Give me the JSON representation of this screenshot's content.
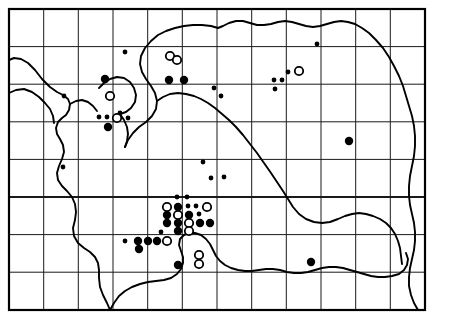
{
  "map": {
    "title": "Species distribution map",
    "description": "Dot distribution map of a region with a coastline outline and a rectangular grid of recording squares.",
    "colors": {
      "background": "#ffffff",
      "grid": "#1a1a1a",
      "border": "#000000",
      "coastline": "#000000",
      "symbol_filled": "#000000",
      "symbol_open_stroke": "#000000",
      "symbol_open_fill": "#ffffff"
    },
    "frame": {
      "x": 9,
      "y": 9,
      "width": 416,
      "height": 301
    },
    "grid": {
      "columns": 12,
      "rows": 8,
      "x_lines": [
        9,
        43.7,
        78.3,
        113,
        147.7,
        182.3,
        217,
        251.7,
        286.3,
        321,
        355.7,
        390.3,
        425
      ],
      "y_lines": [
        9,
        46.6,
        84.2,
        121.8,
        159.4,
        197,
        234.6,
        272.2,
        310
      ],
      "emphasis_x": 232,
      "emphasis_y": 197
    },
    "legend": {
      "symbols": [
        {
          "name": "large-filled-dot",
          "meaning": "record",
          "radius": 4.2,
          "style": "filled"
        },
        {
          "name": "small-filled-dot",
          "meaning": "record",
          "radius": 2.4,
          "style": "filled"
        },
        {
          "name": "open-circle",
          "meaning": "old record",
          "radius": 4.2,
          "style": "open"
        }
      ]
    },
    "coastline_paths": [
      "M 9,60 L 14,58 L 21,59 L 28,63 L 35,70 L 42,79 L 50,87 L 57,92 L 63,95 L 68,99 L 70,104 L 69,110 L 66,115 L 62,118 L 58,122 L 56,128 L 57,134 L 60,139 L 63,145 L 64,152 L 62,159 L 59,166 L 57,173 L 58,180 L 62,186 L 67,191 L 72,197 L 75,204 L 76,212 L 75,220 L 73,228 L 74,236 L 78,243 L 84,248 L 90,252 L 95,257 L 98,263 L 99,270 L 99,278 L 100,287 L 103,295 L 107,303 L 110,310",
      "M 9,93 L 16,90 L 24,89 L 32,92 L 39,97 L 45,103 L 50,109 L 53,116 L 54,123",
      "M 70,104 L 76,101 L 82,100 L 88,102 L 93,106 L 97,111",
      "M 99,88 L 104,83 L 110,79 L 117,77 L 124,78 L 130,82 L 134,88 L 136,95 L 135,102 L 131,108 L 126,112 L 120,114",
      "M 120,114 L 124,120 L 127,127 L 128,134 L 127,141 L 125,147",
      "M 125,147 L 128,140 L 133,133 L 139,127 L 146,122 L 152,116 L 156,109 L 157,101 L 155,93 L 151,86 L 146,79 L 142,72 L 140,64 L 141,56 L 145,48 L 151,41 L 158,35 L 166,31 L 175,28 L 184,26 L 193,25 L 202,25 L 211,26 L 218,28 L 223,26 L 229,23 L 236,21 L 243,21 L 250,23 L 257,25 L 264,25 L 271,24 L 278,22 L 285,21 L 292,22 L 299,24 L 306,26 L 313,27 L 320,26 L 327,24 L 334,22 L 341,21 L 348,22 L 355,24 L 362,28 L 369,33 L 376,40 L 383,48 L 389,57 L 394,66 L 399,76 L 403,86 L 406,96 L 409,106 L 412,116 L 414,126 L 415,136 L 415,146 L 414,156 L 412,166 L 410,176 L 409,186 L 409,196 L 410,205 L 412,214 L 414,223 L 415,232 L 415,241 L 414,250 L 412,259 L 410,268 L 409,277 L 409,286 L 411,295 L 414,303 L 418,310",
      "M 157,101 L 163,97 L 170,94 L 178,93 L 186,94 L 194,96 L 201,99 L 208,103 L 215,108 L 222,114 L 229,120 L 236,127 L 243,135 L 250,144 L 257,153 L 264,163 L 271,173 L 277,182 L 283,191 L 288,199 L 293,207 L 299,214 L 306,219 L 314,222 L 322,223 L 330,222 L 338,219 L 345,216 L 352,214 L 359,213 L 366,214 L 373,216 L 380,219 L 386,223 L 391,228 L 395,234 L 398,241 L 400,248 L 401,256 L 402,264",
      "M 110,310 L 114,303 L 119,296 L 125,291 L 132,287 L 140,284 L 148,282 L 156,281 L 164,280 L 171,278 L 177,274 L 181,269 L 183,263 L 183,257 L 181,251 L 179,245 L 180,239 L 184,235 L 189,233 L 195,233 L 201,235 L 206,239 L 210,244 L 213,250 L 216,256 L 220,261 L 225,265 L 231,268 L 238,270 L 245,271 L 252,271 L 259,270 L 266,269 L 273,269 L 280,270 L 287,272 L 294,273 L 301,273 L 308,272 L 315,270 L 322,268 L 329,267 L 336,267 L 343,268 L 350,270 L 357,272 L 364,274 L 371,276 L 378,277 L 385,277 L 392,276 L 399,274 L 404,270 L 407,265 L 408,259 L 406,253"
    ],
    "symbols": [
      {
        "name": "open-circle",
        "x": 170,
        "y": 56,
        "r": 4.2,
        "style": "open"
      },
      {
        "name": "small-filled-dot",
        "x": 125,
        "y": 52,
        "r": 2.4,
        "style": "filled"
      },
      {
        "name": "open-circle",
        "x": 177,
        "y": 60,
        "r": 4.2,
        "style": "open"
      },
      {
        "name": "small-filled-dot",
        "x": 317,
        "y": 44,
        "r": 2.4,
        "style": "filled"
      },
      {
        "name": "large-filled-dot",
        "x": 105,
        "y": 79,
        "r": 4.2,
        "style": "filled"
      },
      {
        "name": "large-filled-dot",
        "x": 169,
        "y": 80,
        "r": 4.2,
        "style": "filled"
      },
      {
        "name": "large-filled-dot",
        "x": 184,
        "y": 80,
        "r": 4.2,
        "style": "filled"
      },
      {
        "name": "small-filled-dot",
        "x": 214,
        "y": 88,
        "r": 2.4,
        "style": "filled"
      },
      {
        "name": "small-filled-dot",
        "x": 221,
        "y": 96,
        "r": 2.4,
        "style": "filled"
      },
      {
        "name": "small-filled-dot",
        "x": 288,
        "y": 72,
        "r": 2.4,
        "style": "filled"
      },
      {
        "name": "open-circle",
        "x": 299,
        "y": 71,
        "r": 4.2,
        "style": "open"
      },
      {
        "name": "small-filled-dot",
        "x": 274,
        "y": 80,
        "r": 2.4,
        "style": "filled"
      },
      {
        "name": "small-filled-dot",
        "x": 282,
        "y": 80,
        "r": 2.4,
        "style": "filled"
      },
      {
        "name": "small-filled-dot",
        "x": 275,
        "y": 89,
        "r": 2.4,
        "style": "filled"
      },
      {
        "name": "open-circle",
        "x": 110,
        "y": 96,
        "r": 4.2,
        "style": "open"
      },
      {
        "name": "small-filled-dot",
        "x": 64,
        "y": 96,
        "r": 2.4,
        "style": "filled"
      },
      {
        "name": "small-filled-dot",
        "x": 120,
        "y": 113,
        "r": 2.4,
        "style": "filled"
      },
      {
        "name": "small-filled-dot",
        "x": 99,
        "y": 117,
        "r": 2.4,
        "style": "filled"
      },
      {
        "name": "small-filled-dot",
        "x": 107,
        "y": 117,
        "r": 2.4,
        "style": "filled"
      },
      {
        "name": "open-circle",
        "x": 117,
        "y": 118,
        "r": 4.2,
        "style": "open"
      },
      {
        "name": "small-filled-dot",
        "x": 128,
        "y": 118,
        "r": 2.4,
        "style": "filled"
      },
      {
        "name": "large-filled-dot",
        "x": 108,
        "y": 127,
        "r": 4.2,
        "style": "filled"
      },
      {
        "name": "large-filled-dot",
        "x": 349,
        "y": 141,
        "r": 4.2,
        "style": "filled"
      },
      {
        "name": "small-filled-dot",
        "x": 63,
        "y": 167,
        "r": 2.4,
        "style": "filled"
      },
      {
        "name": "small-filled-dot",
        "x": 203,
        "y": 162,
        "r": 2.4,
        "style": "filled"
      },
      {
        "name": "small-filled-dot",
        "x": 211,
        "y": 178,
        "r": 2.4,
        "style": "filled"
      },
      {
        "name": "small-filled-dot",
        "x": 224,
        "y": 177,
        "r": 2.4,
        "style": "filled"
      },
      {
        "name": "small-filled-dot",
        "x": 177,
        "y": 197,
        "r": 2.4,
        "style": "filled"
      },
      {
        "name": "small-filled-dot",
        "x": 187,
        "y": 197,
        "r": 2.4,
        "style": "filled"
      },
      {
        "name": "open-circle",
        "x": 167,
        "y": 207,
        "r": 4.2,
        "style": "open"
      },
      {
        "name": "large-filled-dot",
        "x": 178,
        "y": 207,
        "r": 4.2,
        "style": "filled"
      },
      {
        "name": "small-filled-dot",
        "x": 188,
        "y": 206,
        "r": 2.4,
        "style": "filled"
      },
      {
        "name": "small-filled-dot",
        "x": 196,
        "y": 206,
        "r": 2.4,
        "style": "filled"
      },
      {
        "name": "open-circle",
        "x": 207,
        "y": 207,
        "r": 4.2,
        "style": "open"
      },
      {
        "name": "large-filled-dot",
        "x": 167,
        "y": 215,
        "r": 4.2,
        "style": "filled"
      },
      {
        "name": "open-circle",
        "x": 178,
        "y": 215,
        "r": 4.2,
        "style": "open"
      },
      {
        "name": "large-filled-dot",
        "x": 189,
        "y": 215,
        "r": 4.2,
        "style": "filled"
      },
      {
        "name": "small-filled-dot",
        "x": 199,
        "y": 214,
        "r": 2.4,
        "style": "filled"
      },
      {
        "name": "large-filled-dot",
        "x": 167,
        "y": 223,
        "r": 4.2,
        "style": "filled"
      },
      {
        "name": "large-filled-dot",
        "x": 178,
        "y": 223,
        "r": 4.2,
        "style": "filled"
      },
      {
        "name": "open-circle",
        "x": 189,
        "y": 223,
        "r": 4.2,
        "style": "open"
      },
      {
        "name": "large-filled-dot",
        "x": 200,
        "y": 223,
        "r": 4.2,
        "style": "filled"
      },
      {
        "name": "large-filled-dot",
        "x": 210,
        "y": 223,
        "r": 4.2,
        "style": "filled"
      },
      {
        "name": "large-filled-dot",
        "x": 178,
        "y": 231,
        "r": 4.2,
        "style": "filled"
      },
      {
        "name": "open-circle",
        "x": 189,
        "y": 231,
        "r": 4.2,
        "style": "open"
      },
      {
        "name": "small-filled-dot",
        "x": 161,
        "y": 232,
        "r": 2.4,
        "style": "filled"
      },
      {
        "name": "small-filled-dot",
        "x": 125,
        "y": 241,
        "r": 2.4,
        "style": "filled"
      },
      {
        "name": "large-filled-dot",
        "x": 138,
        "y": 241,
        "r": 4.2,
        "style": "filled"
      },
      {
        "name": "large-filled-dot",
        "x": 148,
        "y": 241,
        "r": 4.2,
        "style": "filled"
      },
      {
        "name": "large-filled-dot",
        "x": 157,
        "y": 241,
        "r": 4.2,
        "style": "filled"
      },
      {
        "name": "open-circle",
        "x": 167,
        "y": 241,
        "r": 4.2,
        "style": "open"
      },
      {
        "name": "large-filled-dot",
        "x": 139,
        "y": 249,
        "r": 4.2,
        "style": "filled"
      },
      {
        "name": "open-circle",
        "x": 199,
        "y": 255,
        "r": 4.2,
        "style": "open"
      },
      {
        "name": "large-filled-dot",
        "x": 178,
        "y": 265,
        "r": 4.2,
        "style": "filled"
      },
      {
        "name": "open-circle",
        "x": 199,
        "y": 264,
        "r": 4.2,
        "style": "open"
      },
      {
        "name": "large-filled-dot",
        "x": 311,
        "y": 262,
        "r": 4.2,
        "style": "filled"
      }
    ]
  }
}
